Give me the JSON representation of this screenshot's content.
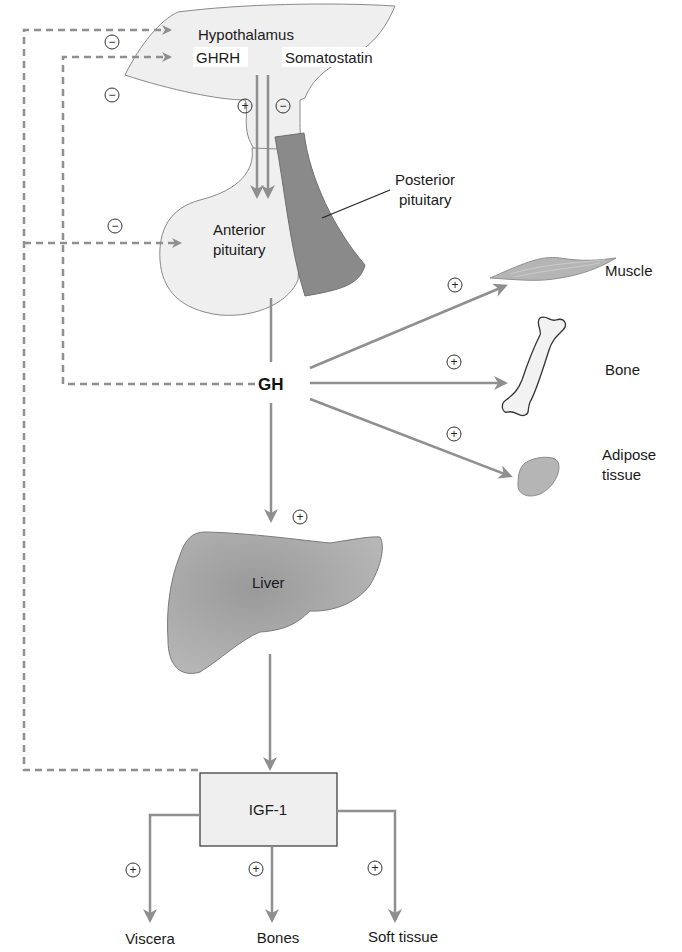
{
  "diagram": {
    "type": "physiology-flow",
    "colors": {
      "arrow": "#8f8f8f",
      "dashed": "#8f8f8f",
      "pale_fill": "#efefef",
      "dark_fill": "#8a8a8a",
      "mid_fill": "#a9a9a9",
      "outline": "#6a6a6a"
    },
    "organs": {
      "hypothalamus": "Hypothalamus",
      "anterior_pituitary_line1": "Anterior",
      "anterior_pituitary_line2": "pituitary",
      "posterior_pituitary_line1": "Posterior",
      "posterior_pituitary_line2": "pituitary",
      "liver": "Liver"
    },
    "hormones": {
      "ghrh": "GHRH",
      "somatostatin": "Somatostatin",
      "gh": "GH",
      "igf1": "IGF-1"
    },
    "gh_targets": [
      {
        "label": "Muscle",
        "sign": "+"
      },
      {
        "label": "Bone",
        "sign": "+"
      },
      {
        "label_line1": "Adipose",
        "label_line2": "tissue",
        "sign": "+"
      }
    ],
    "liver_sign": "+",
    "igf1_targets": [
      {
        "label": "Viscera",
        "sign": "+"
      },
      {
        "label": "Bones",
        "sign": "+"
      },
      {
        "label": "Soft tissue",
        "sign": "+"
      }
    ],
    "feedback": {
      "ghrh_sign": "+",
      "somatostatin_sign": "−",
      "igf1_to_hypothalamus_sign": "−",
      "gh_to_hypothalamus_sign": "−",
      "igf1_to_pituitary_sign": "−"
    }
  }
}
